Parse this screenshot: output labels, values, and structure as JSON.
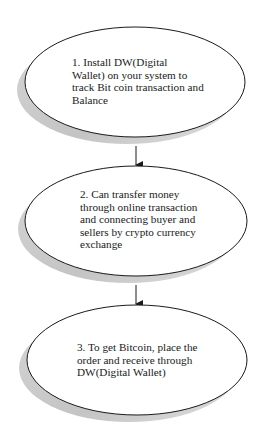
{
  "diagram": {
    "type": "flowchart",
    "colors": {
      "background": "#ffffff",
      "node_fill": "#ffffff",
      "node_stroke": "#1a1a1a",
      "shadow": "#c4c4c4",
      "arrow": "#1a1a1a",
      "text": "#1a1a1a"
    },
    "nodes": [
      {
        "id": "step1",
        "text": "1. Install DW(Digital\nWallet) on your system to\ntrack Bit coin transaction and\nBalance"
      },
      {
        "id": "step2",
        "text": "2. Can transfer money\nthrough online transaction\nand connecting buyer and\nsellers by crypto currency\nexchange"
      },
      {
        "id": "step3",
        "text": "3. To get Bitcoin, place the\norder and receive through\nDW(Digital Wallet)"
      }
    ],
    "edges": [
      {
        "from": "step1",
        "to": "step2"
      },
      {
        "from": "step2",
        "to": "step3"
      }
    ]
  }
}
